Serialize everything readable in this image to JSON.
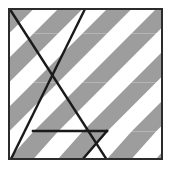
{
  "figure": {
    "title": "Tessellated rhombus stripe pattern with overlaid polyline figure",
    "canvas": {
      "width": 173,
      "height": 170
    },
    "colors": {
      "background": "#ffffff",
      "tile_light": "#ffffff",
      "tile_gray": "#9d9d9d",
      "frame_stroke": "#2b2b2b",
      "overlay_stroke": "#1a1a1a"
    },
    "frame": {
      "x": 8,
      "y": 8,
      "width": 155,
      "height": 152,
      "stroke_width": 2
    },
    "pattern": {
      "type": "rhombus-tessellation",
      "band_height": 24.5,
      "band_count": 6,
      "diagonal_dx": -24.5,
      "cell_width": 49,
      "shear_description": "parallelograms slanting from upper-right to lower-left at 45 degrees"
    },
    "overlay": {
      "stroke_width": 2.4,
      "paths": [
        {
          "name": "long-diagonal-down-right",
          "points": "12,12 106,160"
        },
        {
          "name": "long-diagonal-down-left",
          "points": "84,10 12,158"
        },
        {
          "name": "parallelogram-top-edge",
          "points": "33,131 106,131"
        },
        {
          "name": "parallelogram-right-edge",
          "points": "106,131 82,160"
        }
      ]
    }
  }
}
